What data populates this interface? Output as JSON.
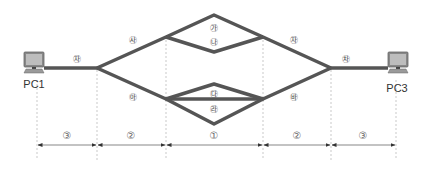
{
  "diagram": {
    "type": "network-topology",
    "nodes": {
      "pc1": {
        "label": "PC1"
      },
      "pc3": {
        "label": "PC3"
      }
    },
    "link_labels": {
      "left_access": "㉶",
      "upper_left": "㉴",
      "lower_left": "㉵",
      "top_upper": "㉮",
      "top_lower": "㉯",
      "bottom_upper": "㉰",
      "bottom_lower": "㉱",
      "upper_right": "㉶",
      "lower_right": "㉳",
      "right_access": "㉷"
    },
    "segments": [
      {
        "label": "③"
      },
      {
        "label": "②"
      },
      {
        "label": "①"
      },
      {
        "label": "②"
      },
      {
        "label": "③"
      }
    ],
    "colors": {
      "link": "#555555",
      "dashed": "#bbbbbb",
      "arrow": "#333333"
    }
  }
}
